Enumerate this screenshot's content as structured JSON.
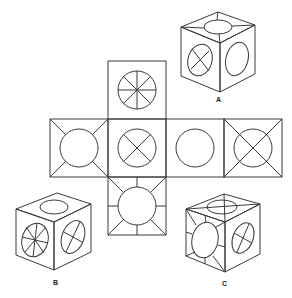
{
  "puzzle": {
    "type": "cube-net-folding",
    "net": {
      "layout": "cross",
      "faces": [
        {
          "position": "top",
          "pattern": "circle-with-8-spokes"
        },
        {
          "position": "middle-left",
          "pattern": "circle-with-corner-diagonals-outside"
        },
        {
          "position": "middle-center",
          "pattern": "circle-with-x-inside"
        },
        {
          "position": "middle-center-right",
          "pattern": "plain-circle"
        },
        {
          "position": "middle-right",
          "pattern": "circle-with-full-diagonals"
        },
        {
          "position": "bottom",
          "pattern": "circle-with-8-rays-outside"
        }
      ]
    },
    "options": [
      {
        "label": "A"
      },
      {
        "label": "B"
      },
      {
        "label": "C"
      }
    ]
  }
}
